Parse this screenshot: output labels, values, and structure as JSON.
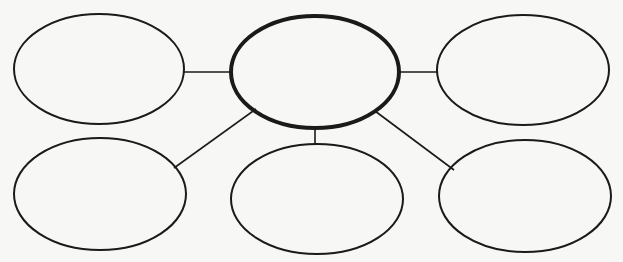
{
  "diagram": {
    "type": "bubble-map",
    "background": "#f7f7f5",
    "stroke_color": "#1a1a1a",
    "center": {
      "id": "center",
      "cx": 315,
      "cy": 72,
      "rx": 84,
      "ry": 56,
      "stroke_width": 4,
      "label": ""
    },
    "nodes": [
      {
        "id": "top-left",
        "cx": 99,
        "cy": 69,
        "rx": 85,
        "ry": 55,
        "stroke_width": 2,
        "label": ""
      },
      {
        "id": "top-right",
        "cx": 523,
        "cy": 70,
        "rx": 86,
        "ry": 55,
        "stroke_width": 2,
        "label": ""
      },
      {
        "id": "bottom-left",
        "cx": 100,
        "cy": 194,
        "rx": 86,
        "ry": 56,
        "stroke_width": 2,
        "label": ""
      },
      {
        "id": "bottom-center",
        "cx": 317,
        "cy": 199,
        "rx": 86,
        "ry": 55,
        "stroke_width": 2,
        "label": ""
      },
      {
        "id": "bottom-right",
        "cx": 525,
        "cy": 196,
        "rx": 86,
        "ry": 56,
        "stroke_width": 2,
        "label": ""
      }
    ],
    "connectors": [
      {
        "from": "center",
        "to": "top-left",
        "x1": 231,
        "y1": 72,
        "x2": 184,
        "y2": 72
      },
      {
        "from": "center",
        "to": "top-right",
        "x1": 399,
        "y1": 72,
        "x2": 437,
        "y2": 72
      },
      {
        "from": "center",
        "to": "bottom-left",
        "x1": 256,
        "y1": 109,
        "x2": 174,
        "y2": 168
      },
      {
        "from": "center",
        "to": "bottom-center",
        "x1": 315,
        "y1": 128,
        "x2": 315,
        "y2": 144
      },
      {
        "from": "center",
        "to": "bottom-right",
        "x1": 375,
        "y1": 111,
        "x2": 454,
        "y2": 170
      }
    ]
  }
}
